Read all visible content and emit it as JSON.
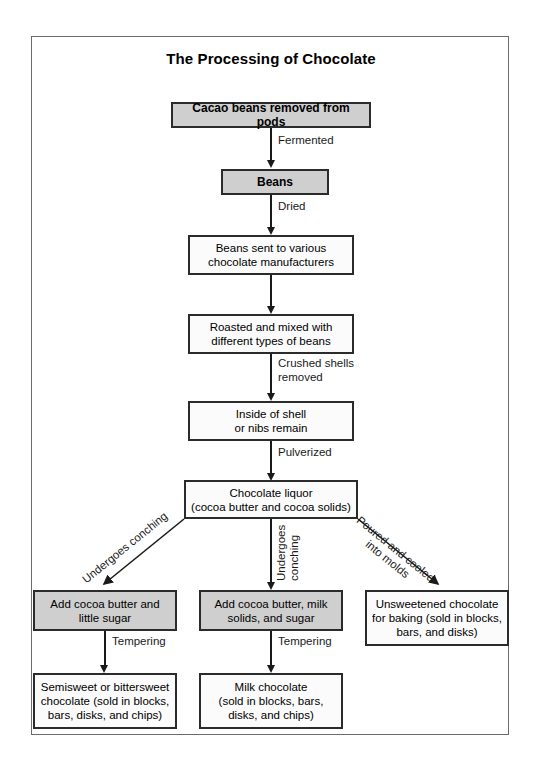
{
  "title": "The Processing of Chocolate",
  "nodes": {
    "cacao_beans": "Cacao beans removed from pods",
    "beans": "Beans",
    "manufacturers": "Beans sent to various\nchocolate manufacturers",
    "roasted": "Roasted and mixed with\ndifferent types of beans",
    "inside_shell": "Inside of shell\nor nibs remain",
    "chocolate_liquor": "Chocolate liquor\n(cocoa butter and cocoa solids)",
    "add_cocoa_little_sugar": "Add cocoa butter and\nlittle sugar",
    "add_cocoa_milk_sugar": "Add cocoa butter, milk\nsolids, and sugar",
    "unsweetened": "Unsweetened chocolate\nfor baking (sold in blocks,\nbars, and disks)",
    "semisweet": "Semisweet or bittersweet\nchocolate (sold in blocks,\nbars, disks, and chips)",
    "milk_chocolate": "Milk chocolate\n(sold in blocks, bars,\ndisks, and chips)"
  },
  "edges": {
    "fermented": "Fermented",
    "dried": "Dried",
    "crushed_shells": "Crushed shells\nremoved",
    "pulverized": "Pulverized",
    "undergoes_conching_left": "Undergoes conching",
    "undergoes_conching_mid": "Undergoes\nconching",
    "poured_cooled": "Poured and cooled\ninto molds",
    "tempering_left": "Tempering",
    "tempering_mid": "Tempering"
  },
  "colors": {
    "shaded_fill": "#cfcfcf",
    "plain_fill": "#fbfbfb",
    "stroke": "#2b2b2b",
    "frame": "#6b6b6b"
  }
}
